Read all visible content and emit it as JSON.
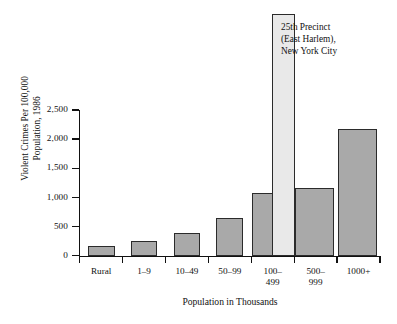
{
  "chart_data": {
    "type": "bar",
    "title": "",
    "xlabel": "Population in Thousands",
    "ylabel_line1": "Violent Crimes Per 100,000",
    "ylabel_line2": "Population, 1986",
    "categories": [
      "Rural",
      "1–9",
      "10–49",
      "50–99",
      "100–\n499",
      "500–\n999",
      "1000+"
    ],
    "values": [
      170,
      255,
      395,
      650,
      1080,
      1165,
      2175
    ],
    "ylim": [
      0,
      2500
    ],
    "yticks": [
      0,
      500,
      1000,
      1500,
      2000,
      2500
    ],
    "ytick_labels": [
      "0",
      "500",
      "1,000",
      "1,500",
      "2,000",
      "2,500"
    ],
    "grid": false,
    "legend": "none",
    "highlight_bar": {
      "label": "25th Precinct\n(East Harlem),\nNew York City",
      "value": 4150,
      "clipped": true,
      "color": "#e9e9e9"
    },
    "bar_color": "#a9a9a9",
    "bar_edge_color": "#2b2b2b",
    "axis_color": "#111111"
  },
  "annotation": {
    "text": "25th Precinct\n(East Harlem),\nNew York City"
  }
}
